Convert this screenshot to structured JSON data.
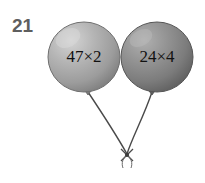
{
  "page": {
    "background_color": "#ffffff",
    "width": 205,
    "height": 183
  },
  "question": {
    "number": "21",
    "color": "#5e5e5e"
  },
  "balloons": [
    {
      "id": "left",
      "label": "47×2",
      "expression": "47 × 2",
      "factors": [
        47,
        2
      ],
      "product": 94,
      "fill_color": "#a9a9a9",
      "highlight_color": "#d2d2d2",
      "shadow_color": "#7b7b7b",
      "outline_color": "#6f6f6f",
      "center_x": 84,
      "center_y": 57,
      "radius_x": 36,
      "radius_y": 35
    },
    {
      "id": "right",
      "label": "24×4",
      "expression": "24 × 4",
      "factors": [
        24,
        4
      ],
      "product": 96,
      "fill_color": "#8a8a8a",
      "highlight_color": "#adadad",
      "shadow_color": "#5e5e5e",
      "outline_color": "#565656",
      "center_x": 157,
      "center_y": 57,
      "radius_x": 36,
      "radius_y": 35
    }
  ],
  "strings": {
    "color": "#4a4a4a",
    "knot_x": 127,
    "knot_y": 155,
    "left_neck_x": 88,
    "left_neck_y": 92,
    "right_neck_x": 152,
    "right_neck_y": 92
  },
  "icons": {
    "balloon": "balloon-icon",
    "knot": "bow-knot-icon",
    "string": "balloon-string-icon"
  }
}
